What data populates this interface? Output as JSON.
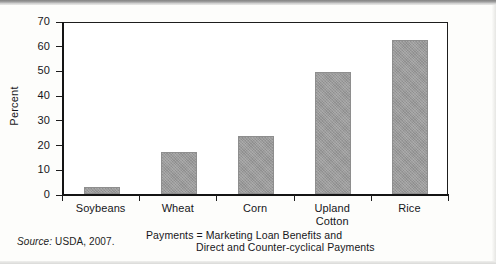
{
  "chart_data": {
    "type": "bar",
    "title": "",
    "xlabel": "Payments = Marketing Loan Benefits and Direct and Counter-cyclical Payments",
    "ylabel": "Percent",
    "ylim": [
      0,
      70
    ],
    "yticks": [
      0,
      10,
      20,
      30,
      40,
      50,
      60,
      70
    ],
    "grid": false,
    "legend": null,
    "categories": [
      "Soybeans",
      "Wheat",
      "Corn",
      "Upland Cotton",
      "Rice"
    ],
    "values": [
      3,
      17,
      23.5,
      49.5,
      62.5
    ],
    "bar_color": "#9a9a9a",
    "axis_color": "#141414"
  },
  "axis": {
    "y_title": "Percent",
    "y_ticks": [
      "70",
      "60",
      "50",
      "40",
      "30",
      "20",
      "10",
      "0"
    ],
    "x_labels": [
      {
        "line1": "Soybeans",
        "line2": ""
      },
      {
        "line1": "Wheat",
        "line2": ""
      },
      {
        "line1": "Corn",
        "line2": ""
      },
      {
        "line1": "Upland",
        "line2": "Cotton"
      },
      {
        "line1": "Rice",
        "line2": ""
      }
    ]
  },
  "notes": {
    "source_word": "Source:",
    "source_text": "USDA, 2007.",
    "caption_line1": "Payments = Marketing Loan Benefits and",
    "caption_line2": "Direct and Counter-cyclical Payments"
  }
}
